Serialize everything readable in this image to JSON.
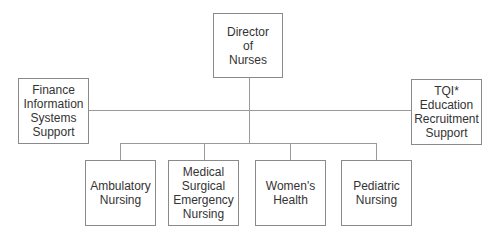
{
  "diagram": {
    "type": "org-chart",
    "root": {
      "label": "Director of Nurses",
      "lines": [
        "Director",
        "of",
        "Nurses"
      ]
    },
    "staff_left": {
      "label": "Finance Information Systems Support",
      "lines": [
        "Finance",
        "Information",
        "Systems",
        "Support"
      ]
    },
    "staff_right": {
      "label": "TQI* Education Recruitment Support",
      "lines": [
        "TQI*",
        "Education",
        "Recruitment",
        "Support"
      ]
    },
    "children": [
      {
        "label": "Ambulatory Nursing",
        "lines": [
          "Ambulatory",
          "Nursing"
        ]
      },
      {
        "label": "Medical Surgical Emergency Nursing",
        "lines": [
          "Medical",
          "Surgical",
          "Emergency",
          "Nursing"
        ]
      },
      {
        "label": "Women's Health",
        "lines": [
          "Women's",
          "Health"
        ]
      },
      {
        "label": "Pediatric Nursing",
        "lines": [
          "Pediatric",
          "Nursing"
        ]
      }
    ],
    "colors": {
      "border": "#8a8a8a",
      "connector": "#9a9a9a",
      "text": "#333333"
    }
  }
}
